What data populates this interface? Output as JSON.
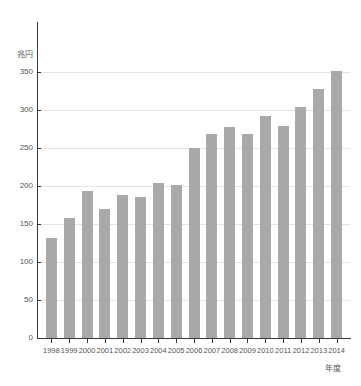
{
  "chart_data": {
    "type": "bar",
    "title": "",
    "subtitle": "",
    "xlabel": "年度",
    "ylabel": "兆円",
    "categories": [
      "1998",
      "1999",
      "2000",
      "2001",
      "2002",
      "2003",
      "2004",
      "2005",
      "2006",
      "2007",
      "2008",
      "2009",
      "2010",
      "2011",
      "2012",
      "2013",
      "2014"
    ],
    "values": [
      132,
      158,
      194,
      170,
      188,
      185,
      204,
      201,
      250,
      268,
      278,
      268,
      292,
      279,
      304,
      327,
      351
    ],
    "series": [
      {
        "name": "兆円",
        "values": [
          132,
          158,
          194,
          170,
          188,
          185,
          204,
          201,
          250,
          268,
          278,
          268,
          292,
          279,
          304,
          327,
          351
        ]
      }
    ],
    "ylim": [
      0,
      350
    ],
    "y_ticks": [
      0,
      50,
      100,
      150,
      200,
      250,
      300,
      350
    ],
    "y_tick_labels": [
      "0",
      "50",
      "100",
      "150",
      "200",
      "250",
      "300",
      "350"
    ],
    "grid": true,
    "grid_axis": "y",
    "legend": false,
    "legend_position": "none",
    "bar_color": "#a9a9a9",
    "axis_color": "#3a3a3a",
    "grid_color": "#e4e4e4",
    "text_color": "#555555",
    "background_color": "#ffffff"
  }
}
